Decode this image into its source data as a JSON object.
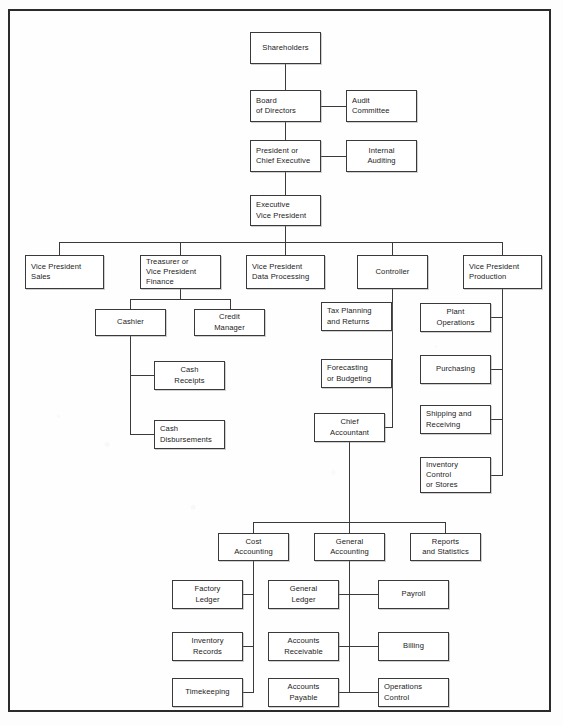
{
  "document": {
    "title": "Organization Chart",
    "type": "hierarchical organizational chart",
    "page_background": "#fdfdfd",
    "line_color": "#3a3a3a",
    "box_fill": "#ffffff"
  },
  "nodes": {
    "shareholders": {
      "label": "Shareholders",
      "level": 1
    },
    "board_of_directors": {
      "label": "Board\nof Directors",
      "level": 2
    },
    "audit_committee": {
      "label": "Audit\nCommittee",
      "level": 2
    },
    "president": {
      "label": "President or\nChief Executive",
      "level": 3
    },
    "internal_auditing": {
      "label": "Internal\nAuditing",
      "level": 3
    },
    "executive_vp": {
      "label": "Executive\nVice President",
      "level": 4
    },
    "vp_sales": {
      "label": "Vice President\nSales",
      "level": 5
    },
    "treasurer": {
      "label": "Treasurer or\nVice President\nFinance",
      "level": 5
    },
    "vp_data_processing": {
      "label": "Vice President\nData Processing",
      "level": 5
    },
    "controller": {
      "label": "Controller",
      "level": 5
    },
    "vp_production": {
      "label": "Vice President\nProduction",
      "level": 5
    },
    "cashier": {
      "label": "Cashier",
      "level": 6
    },
    "credit_manager": {
      "label": "Credit\nManager",
      "level": 6
    },
    "cash_receipts": {
      "label": "Cash\nReceipts",
      "level": 7
    },
    "cash_disbursements": {
      "label": "Cash\nDisbursements",
      "level": 7
    },
    "tax_planning": {
      "label": "Tax Planning\nand Returns",
      "level": 6
    },
    "forecasting": {
      "label": "Forecasting\nor Budgeting",
      "level": 6
    },
    "chief_accountant": {
      "label": "Chief\nAccountant",
      "level": 6
    },
    "plant_operations": {
      "label": "Plant\nOperations",
      "level": 6
    },
    "purchasing": {
      "label": "Purchasing",
      "level": 6
    },
    "shipping_receiving": {
      "label": "Shipping and\nReceiving",
      "level": 6
    },
    "inventory_control": {
      "label": "Inventory\nControl\nor Stores",
      "level": 6
    },
    "cost_accounting": {
      "label": "Cost\nAccounting",
      "level": 7
    },
    "general_accounting": {
      "label": "General\nAccounting",
      "level": 7
    },
    "reports_statistics": {
      "label": "Reports\nand Statistics",
      "level": 7
    },
    "factory_ledger": {
      "label": "Factory\nLedger",
      "level": 8
    },
    "inventory_records": {
      "label": "Inventory\nRecords",
      "level": 8
    },
    "timekeeping": {
      "label": "Timekeeping",
      "level": 8
    },
    "general_ledger": {
      "label": "General\nLedger",
      "level": 8
    },
    "accounts_receivable": {
      "label": "Accounts\nReceivable",
      "level": 8
    },
    "accounts_payable": {
      "label": "Accounts\nPayable",
      "level": 8
    },
    "payroll": {
      "label": "Payroll",
      "level": 8
    },
    "billing": {
      "label": "Billing",
      "level": 8
    },
    "operations_control": {
      "label": "Operations\nControl",
      "level": 8
    }
  },
  "relationships": [
    {
      "from": "shareholders",
      "to": "board_of_directors"
    },
    {
      "from": "board_of_directors",
      "to": "audit_committee"
    },
    {
      "from": "board_of_directors",
      "to": "president"
    },
    {
      "from": "president",
      "to": "internal_auditing"
    },
    {
      "from": "president",
      "to": "executive_vp"
    },
    {
      "from": "executive_vp",
      "to": "vp_sales"
    },
    {
      "from": "executive_vp",
      "to": "treasurer"
    },
    {
      "from": "executive_vp",
      "to": "vp_data_processing"
    },
    {
      "from": "executive_vp",
      "to": "controller"
    },
    {
      "from": "executive_vp",
      "to": "vp_production"
    },
    {
      "from": "treasurer",
      "to": "cashier"
    },
    {
      "from": "treasurer",
      "to": "credit_manager"
    },
    {
      "from": "cashier",
      "to": "cash_receipts"
    },
    {
      "from": "cashier",
      "to": "cash_disbursements"
    },
    {
      "from": "controller",
      "to": "tax_planning"
    },
    {
      "from": "controller",
      "to": "forecasting"
    },
    {
      "from": "controller",
      "to": "chief_accountant"
    },
    {
      "from": "vp_production",
      "to": "plant_operations"
    },
    {
      "from": "vp_production",
      "to": "purchasing"
    },
    {
      "from": "vp_production",
      "to": "shipping_receiving"
    },
    {
      "from": "vp_production",
      "to": "inventory_control"
    },
    {
      "from": "chief_accountant",
      "to": "cost_accounting"
    },
    {
      "from": "chief_accountant",
      "to": "general_accounting"
    },
    {
      "from": "chief_accountant",
      "to": "reports_statistics"
    },
    {
      "from": "cost_accounting",
      "to": "factory_ledger"
    },
    {
      "from": "cost_accounting",
      "to": "inventory_records"
    },
    {
      "from": "cost_accounting",
      "to": "timekeeping"
    },
    {
      "from": "general_accounting",
      "to": "general_ledger"
    },
    {
      "from": "general_accounting",
      "to": "accounts_receivable"
    },
    {
      "from": "general_accounting",
      "to": "accounts_payable"
    },
    {
      "from": "general_accounting",
      "to": "payroll"
    },
    {
      "from": "general_accounting",
      "to": "billing"
    },
    {
      "from": "general_accounting",
      "to": "operations_control"
    }
  ]
}
